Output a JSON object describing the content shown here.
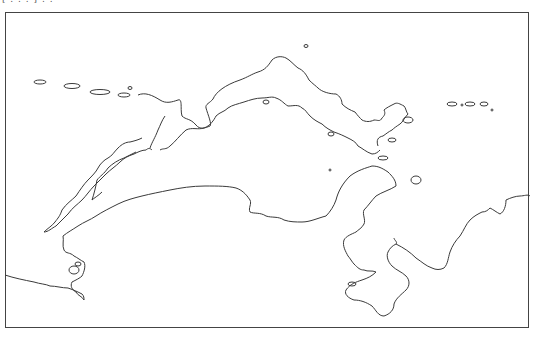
{
  "map": {
    "caption": "[ . . . ] . .",
    "style": "outline coastline map",
    "stroke_color": "#3a3a3a",
    "frame_color": "#444444",
    "background": "#ffffff"
  }
}
